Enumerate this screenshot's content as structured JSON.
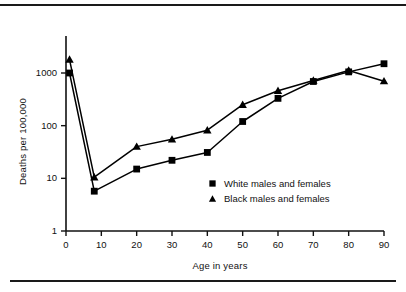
{
  "chart_data": {
    "type": "line",
    "title": "",
    "xlabel": "Age in years",
    "ylabel": "Deaths per 100,000",
    "xlim": [
      0,
      90
    ],
    "ylim": [
      1,
      3000
    ],
    "yscale": "log",
    "grid": false,
    "legend_position": "inside-lower-right",
    "xticks": [
      0,
      10,
      20,
      30,
      40,
      50,
      60,
      70,
      80,
      90
    ],
    "xtick_labels": [
      "0",
      "10",
      "20",
      "30",
      "40",
      "50",
      "60",
      "70",
      "80",
      "90"
    ],
    "yticks": [
      1,
      10,
      100,
      1000
    ],
    "ytick_labels": [
      "1",
      "10",
      "100",
      "1000"
    ],
    "series": [
      {
        "name": "White males and females",
        "marker": "square",
        "color": "#000000",
        "x": [
          1,
          8,
          20,
          30,
          40,
          50,
          60,
          70,
          80,
          90
        ],
        "values": [
          1000,
          5.7,
          15,
          22,
          31,
          120,
          330,
          690,
          1050,
          1500
        ]
      },
      {
        "name": "Black males and females",
        "marker": "triangle",
        "color": "#000000",
        "x": [
          1,
          8,
          20,
          30,
          40,
          50,
          60,
          70,
          80,
          90
        ],
        "values": [
          1800,
          10.5,
          40,
          55,
          82,
          250,
          460,
          720,
          1120,
          700
        ]
      }
    ]
  },
  "axes": {
    "y_title": "Deaths per 100,000",
    "x_title": "Age in years",
    "y_tick_labels": [
      "1000",
      "100",
      "10",
      "1"
    ],
    "x_tick_labels": [
      "0",
      "10",
      "20",
      "30",
      "40",
      "50",
      "60",
      "70",
      "80",
      "90"
    ]
  },
  "legend": {
    "items": [
      {
        "label": "White males and females",
        "marker": "square-marker"
      },
      {
        "label": "Black males and females",
        "marker": "triangle-marker"
      }
    ]
  }
}
